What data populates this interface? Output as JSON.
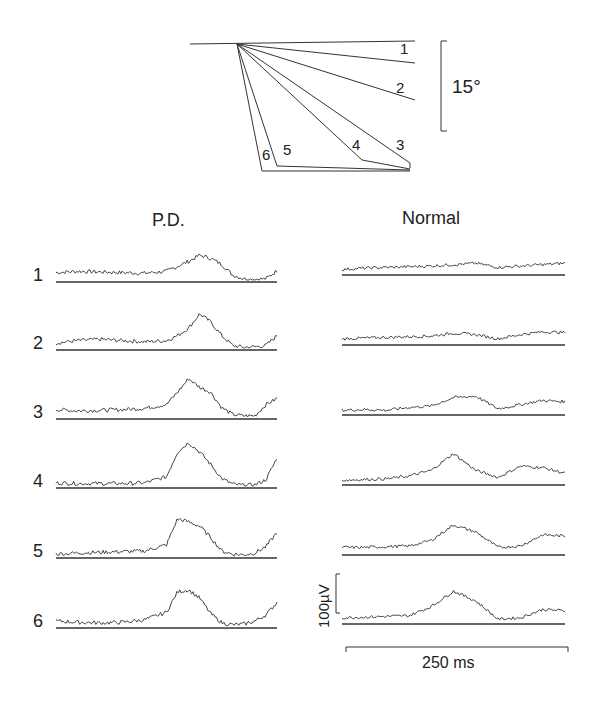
{
  "figure": {
    "angle_panel": {
      "scale_label": "15°",
      "traces": [
        {
          "label": "1",
          "end": [
            415,
            63
          ],
          "label_pos": [
            400,
            54
          ]
        },
        {
          "label": "2",
          "end": [
            415,
            100
          ],
          "label_pos": [
            396,
            93
          ]
        },
        {
          "label": "3",
          "end": [
            410,
            163
          ],
          "label_pos": [
            396,
            150
          ]
        },
        {
          "label": "4",
          "end": [
            362,
            160
          ],
          "label_pos": [
            352,
            150
          ]
        },
        {
          "label": "5",
          "end": [
            277,
            166
          ],
          "label_pos": [
            283,
            155
          ]
        },
        {
          "label": "6",
          "end": [
            262,
            171
          ],
          "label_pos": [
            262,
            160
          ]
        }
      ]
    },
    "pd_panel": {
      "title": "P.D.",
      "rows": [
        "1",
        "2",
        "3",
        "4",
        "5",
        "6"
      ]
    },
    "normal_panel": {
      "title": "Normal"
    },
    "scale_bars": {
      "voltage": "100µV",
      "time": "250 ms"
    }
  },
  "chart_data": {
    "type": "line",
    "angle_scale": "15°",
    "amplitude_scale": "100µV",
    "time_scale": "250 ms",
    "series": [
      {
        "name": "P.D. 1",
        "x": [
          0,
          10,
          20,
          30,
          40,
          50,
          55,
          60,
          65,
          70,
          75,
          80,
          85,
          90,
          95,
          100
        ],
        "y": [
          12,
          14,
          13,
          12,
          11,
          14,
          22,
          30,
          40,
          35,
          25,
          8,
          2,
          1,
          2,
          15
        ]
      },
      {
        "name": "P.D. 2",
        "x": [
          0,
          10,
          20,
          30,
          40,
          50,
          55,
          60,
          65,
          70,
          75,
          80,
          85,
          90,
          95,
          100
        ],
        "y": [
          8,
          12,
          14,
          12,
          10,
          12,
          20,
          32,
          55,
          42,
          20,
          4,
          1,
          2,
          4,
          20
        ]
      },
      {
        "name": "P.D. 3",
        "x": [
          0,
          10,
          20,
          30,
          40,
          50,
          55,
          60,
          65,
          70,
          75,
          80,
          85,
          90,
          95,
          100
        ],
        "y": [
          12,
          10,
          11,
          12,
          14,
          20,
          40,
          62,
          48,
          40,
          15,
          4,
          2,
          2,
          20,
          30
        ]
      },
      {
        "name": "P.D. 4",
        "x": [
          0,
          10,
          20,
          30,
          40,
          50,
          55,
          60,
          65,
          70,
          75,
          80,
          85,
          90,
          95,
          100
        ],
        "y": [
          5,
          4,
          4,
          4,
          5,
          15,
          55,
          70,
          55,
          35,
          12,
          3,
          1,
          2,
          10,
          45
        ]
      },
      {
        "name": "P.D. 5",
        "x": [
          0,
          10,
          20,
          30,
          40,
          50,
          55,
          60,
          65,
          70,
          75,
          80,
          85,
          90,
          95,
          100
        ],
        "y": [
          3,
          5,
          6,
          7,
          8,
          18,
          60,
          55,
          48,
          30,
          8,
          3,
          2,
          5,
          15,
          38
        ]
      },
      {
        "name": "P.D. 6",
        "x": [
          0,
          10,
          20,
          30,
          40,
          50,
          55,
          60,
          65,
          70,
          75,
          80,
          85,
          90,
          95,
          100
        ],
        "y": [
          8,
          6,
          5,
          6,
          10,
          22,
          55,
          58,
          45,
          20,
          5,
          2,
          3,
          8,
          18,
          38
        ]
      },
      {
        "name": "Normal 1",
        "x": [
          0,
          10,
          20,
          30,
          40,
          50,
          60,
          70,
          80,
          90,
          100
        ],
        "y": [
          5,
          7,
          8,
          9,
          10,
          12,
          14,
          8,
          10,
          12,
          14
        ]
      },
      {
        "name": "Normal 2",
        "x": [
          0,
          10,
          20,
          30,
          40,
          50,
          60,
          70,
          80,
          90,
          100
        ],
        "y": [
          6,
          7,
          8,
          9,
          10,
          14,
          12,
          6,
          12,
          16,
          15
        ]
      },
      {
        "name": "Normal 3",
        "x": [
          0,
          10,
          20,
          30,
          40,
          50,
          60,
          70,
          80,
          90,
          100
        ],
        "y": [
          4,
          5,
          4,
          8,
          10,
          22,
          24,
          6,
          12,
          18,
          16
        ]
      },
      {
        "name": "Normal 4",
        "x": [
          0,
          10,
          20,
          30,
          40,
          50,
          60,
          70,
          80,
          90,
          100
        ],
        "y": [
          4,
          5,
          6,
          10,
          18,
          42,
          18,
          8,
          24,
          22,
          14
        ]
      },
      {
        "name": "Normal 5",
        "x": [
          0,
          10,
          20,
          30,
          40,
          50,
          60,
          70,
          80,
          90,
          100
        ],
        "y": [
          8,
          8,
          9,
          10,
          18,
          40,
          30,
          8,
          10,
          26,
          24
        ]
      },
      {
        "name": "Normal 6",
        "x": [
          0,
          10,
          20,
          30,
          40,
          50,
          60,
          70,
          80,
          90,
          100
        ],
        "y": [
          6,
          7,
          8,
          9,
          22,
          44,
          30,
          4,
          6,
          18,
          16
        ]
      }
    ]
  }
}
